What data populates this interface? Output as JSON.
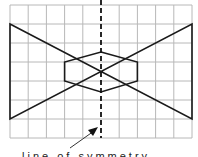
{
  "diagram": {
    "type": "grid-symmetry",
    "grid": {
      "columns": 10,
      "rows": 7,
      "left": 10,
      "top": 5,
      "right": 192,
      "bottom": 138,
      "color": "#b8b8b8"
    },
    "axis": {
      "x": 101,
      "style": "dashed",
      "color": "#111111"
    },
    "bowtie": {
      "points": "10,24 192,119 192,24 10,119",
      "color": "#1a1a1a"
    },
    "hexagon": {
      "points": "101,52 137,62 137,81 101,92 65,81 65,62",
      "color": "#1a1a1a"
    },
    "arrow": {
      "from": [
        70,
        148
      ],
      "to": [
        97,
        129
      ]
    },
    "label": "line of symmetry"
  }
}
